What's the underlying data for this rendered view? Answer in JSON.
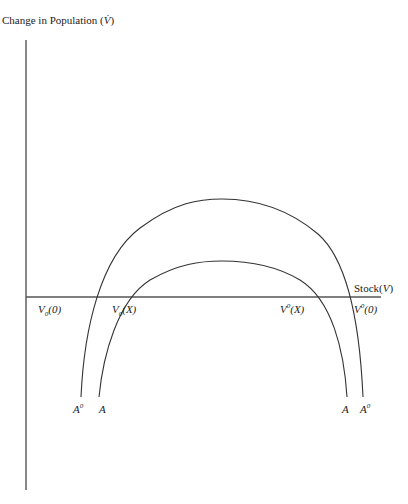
{
  "diagram": {
    "title": "Change in Population (V̇)",
    "y_axis_label": "Change in Population",
    "y_axis_symbol": "V̇",
    "x_axis_label": "Stock",
    "x_axis_symbol": "V",
    "curves": [
      {
        "name": "A⁰",
        "left_label": "A",
        "left_sup": "0",
        "right_label": "A",
        "right_sup": "0",
        "role": "outer"
      },
      {
        "name": "A",
        "left_label": "A",
        "right_label": "A",
        "role": "inner"
      }
    ],
    "intercepts": [
      {
        "label": "V",
        "sub": "0",
        "arg": "(0)",
        "curve": "outer",
        "side": "left"
      },
      {
        "label": "V",
        "sub": "0",
        "arg": "(X)",
        "curve": "inner",
        "side": "left"
      },
      {
        "label": "V",
        "sup": "0",
        "arg": "(X)",
        "curve": "inner",
        "side": "right"
      },
      {
        "label": "V",
        "sup": "0",
        "arg": "(0)",
        "curve": "outer",
        "side": "right"
      }
    ]
  }
}
